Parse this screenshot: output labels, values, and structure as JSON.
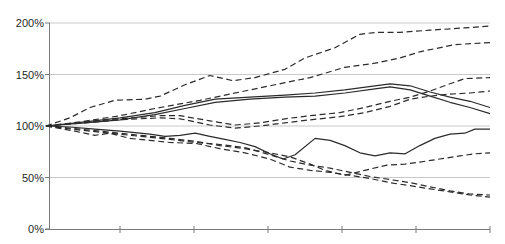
{
  "chart_data": {
    "type": "line",
    "title": "",
    "xlabel": "",
    "ylabel": "",
    "grid": true,
    "legend": "none",
    "colors": {
      "line": "#2b2b2b",
      "grid": "#c9c9c9",
      "axis": "#7a7a7a",
      "label": "#1f1f1f",
      "background": "#ffffff"
    },
    "y_axis": {
      "min": 0,
      "max": 200,
      "tick_step": 50,
      "ticks": [
        {
          "label": "200%",
          "value": 200
        },
        {
          "label": "150%",
          "value": 150
        },
        {
          "label": "100%",
          "value": 100
        },
        {
          "label": "50%",
          "value": 50
        },
        {
          "label": "0%",
          "value": 0
        }
      ]
    },
    "x_axis": {
      "labels": [],
      "tick_intervals": 6
    },
    "series": [
      {
        "name": "series-1",
        "style": "dashed",
        "points": [
          [
            0,
            100
          ],
          [
            0.054,
            108
          ],
          [
            0.099,
            118
          ],
          [
            0.155,
            125
          ],
          [
            0.223,
            126
          ],
          [
            0.257,
            129
          ],
          [
            0.313,
            140
          ],
          [
            0.369,
            149
          ],
          [
            0.421,
            144
          ],
          [
            0.471,
            147
          ],
          [
            0.538,
            155
          ],
          [
            0.583,
            166
          ],
          [
            0.651,
            176
          ],
          [
            0.707,
            189
          ],
          [
            0.745,
            191
          ],
          [
            0.797,
            191
          ],
          [
            0.865,
            193
          ],
          [
            0.932,
            195
          ],
          [
            1,
            197
          ]
        ]
      },
      {
        "name": "series-2",
        "style": "dashed",
        "points": [
          [
            0,
            100
          ],
          [
            0.077,
            104
          ],
          [
            0.167,
            110
          ],
          [
            0.245,
            117
          ],
          [
            0.347,
            125
          ],
          [
            0.437,
            133
          ],
          [
            0.538,
            142
          ],
          [
            0.595,
            147
          ],
          [
            0.673,
            157
          ],
          [
            0.741,
            161
          ],
          [
            0.797,
            166
          ],
          [
            0.842,
            172
          ],
          [
            0.921,
            179
          ],
          [
            1,
            181
          ]
        ]
      },
      {
        "name": "series-3",
        "style": "dashed",
        "points": [
          [
            0,
            100
          ],
          [
            0.088,
            104
          ],
          [
            0.167,
            107
          ],
          [
            0.257,
            110
          ],
          [
            0.302,
            110
          ],
          [
            0.369,
            105
          ],
          [
            0.426,
            101
          ],
          [
            0.482,
            103
          ],
          [
            0.538,
            107
          ],
          [
            0.595,
            110
          ],
          [
            0.662,
            113
          ],
          [
            0.718,
            118
          ],
          [
            0.775,
            124
          ],
          [
            0.82,
            128
          ],
          [
            0.865,
            134
          ],
          [
            0.91,
            141
          ],
          [
            0.943,
            146
          ],
          [
            1,
            147
          ]
        ]
      },
      {
        "name": "series-4",
        "style": "dashed",
        "points": [
          [
            0,
            100
          ],
          [
            0.088,
            103
          ],
          [
            0.167,
            106
          ],
          [
            0.257,
            108
          ],
          [
            0.302,
            107
          ],
          [
            0.369,
            101
          ],
          [
            0.426,
            98
          ],
          [
            0.482,
            100
          ],
          [
            0.538,
            103
          ],
          [
            0.595,
            106
          ],
          [
            0.662,
            109
          ],
          [
            0.718,
            113
          ],
          [
            0.775,
            119
          ],
          [
            0.82,
            126
          ],
          [
            0.865,
            129
          ],
          [
            0.91,
            131
          ],
          [
            0.955,
            132
          ],
          [
            1,
            134
          ]
        ]
      },
      {
        "name": "series-5",
        "style": "solid",
        "points": [
          [
            0,
            100
          ],
          [
            0.088,
            104
          ],
          [
            0.167,
            108
          ],
          [
            0.245,
            113
          ],
          [
            0.313,
            120
          ],
          [
            0.381,
            126
          ],
          [
            0.459,
            128
          ],
          [
            0.538,
            130
          ],
          [
            0.606,
            132
          ],
          [
            0.673,
            135
          ],
          [
            0.741,
            139
          ],
          [
            0.775,
            141
          ],
          [
            0.82,
            139
          ],
          [
            0.865,
            133
          ],
          [
            0.91,
            128
          ],
          [
            0.955,
            124
          ],
          [
            1,
            118
          ]
        ]
      },
      {
        "name": "series-6",
        "style": "solid",
        "points": [
          [
            0,
            100
          ],
          [
            0.088,
            103
          ],
          [
            0.167,
            106
          ],
          [
            0.245,
            111
          ],
          [
            0.313,
            117
          ],
          [
            0.381,
            123
          ],
          [
            0.459,
            126
          ],
          [
            0.538,
            128
          ],
          [
            0.606,
            129
          ],
          [
            0.673,
            132
          ],
          [
            0.741,
            136
          ],
          [
            0.775,
            138
          ],
          [
            0.82,
            135
          ],
          [
            0.865,
            129
          ],
          [
            0.91,
            123
          ],
          [
            0.955,
            118
          ],
          [
            1,
            112
          ]
        ]
      },
      {
        "name": "series-7",
        "style": "solid",
        "points": [
          [
            0,
            100
          ],
          [
            0.054,
            99
          ],
          [
            0.11,
            97
          ],
          [
            0.167,
            95
          ],
          [
            0.234,
            92
          ],
          [
            0.268,
            90
          ],
          [
            0.302,
            91
          ],
          [
            0.336,
            93
          ],
          [
            0.369,
            90
          ],
          [
            0.403,
            87
          ],
          [
            0.437,
            84
          ],
          [
            0.471,
            80
          ],
          [
            0.504,
            73
          ],
          [
            0.534,
            68
          ],
          [
            0.561,
            72
          ],
          [
            0.606,
            88
          ],
          [
            0.64,
            86
          ],
          [
            0.673,
            81
          ],
          [
            0.707,
            74
          ],
          [
            0.741,
            71
          ],
          [
            0.775,
            74
          ],
          [
            0.809,
            73
          ],
          [
            0.842,
            81
          ],
          [
            0.876,
            88
          ],
          [
            0.91,
            92
          ],
          [
            0.943,
            93
          ],
          [
            0.966,
            97
          ],
          [
            1,
            97
          ]
        ]
      },
      {
        "name": "series-8",
        "style": "dashed",
        "points": [
          [
            0,
            100
          ],
          [
            0.077,
            97
          ],
          [
            0.144,
            94
          ],
          [
            0.212,
            91
          ],
          [
            0.279,
            88
          ],
          [
            0.338,
            85
          ],
          [
            0.392,
            81
          ],
          [
            0.448,
            78
          ],
          [
            0.504,
            74
          ],
          [
            0.55,
            70
          ],
          [
            0.595,
            63
          ],
          [
            0.628,
            57
          ],
          [
            0.673,
            52
          ],
          [
            0.718,
            57
          ],
          [
            0.768,
            62
          ],
          [
            0.809,
            63
          ],
          [
            0.842,
            65
          ],
          [
            0.887,
            68
          ],
          [
            0.932,
            71
          ],
          [
            0.966,
            73
          ],
          [
            1,
            74
          ]
        ]
      },
      {
        "name": "series-9",
        "style": "dashed",
        "points": [
          [
            0,
            100
          ],
          [
            0.077,
            96
          ],
          [
            0.144,
            93
          ],
          [
            0.212,
            90
          ],
          [
            0.279,
            87
          ],
          [
            0.338,
            84
          ],
          [
            0.392,
            82
          ],
          [
            0.448,
            79
          ],
          [
            0.504,
            72
          ],
          [
            0.55,
            66
          ],
          [
            0.595,
            62
          ],
          [
            0.64,
            59
          ],
          [
            0.685,
            55
          ],
          [
            0.73,
            51
          ],
          [
            0.775,
            48
          ],
          [
            0.82,
            45
          ],
          [
            0.865,
            41
          ],
          [
            0.91,
            37
          ],
          [
            0.955,
            34
          ],
          [
            1,
            33
          ]
        ]
      },
      {
        "name": "series-10",
        "style": "dashed",
        "points": [
          [
            0,
            100
          ],
          [
            0.065,
            95
          ],
          [
            0.11,
            91
          ],
          [
            0.144,
            93
          ],
          [
            0.189,
            88
          ],
          [
            0.234,
            86
          ],
          [
            0.279,
            84
          ],
          [
            0.338,
            83
          ],
          [
            0.392,
            78
          ],
          [
            0.448,
            74
          ],
          [
            0.504,
            68
          ],
          [
            0.55,
            60
          ],
          [
            0.595,
            57
          ],
          [
            0.64,
            55
          ],
          [
            0.685,
            52
          ],
          [
            0.73,
            49
          ],
          [
            0.775,
            45
          ],
          [
            0.82,
            42
          ],
          [
            0.865,
            39
          ],
          [
            0.91,
            36
          ],
          [
            0.955,
            33
          ],
          [
            1,
            31
          ]
        ]
      }
    ]
  }
}
